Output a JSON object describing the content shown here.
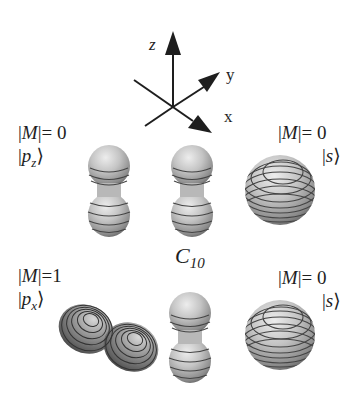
{
  "figure": {
    "axes": {
      "z_label": "z",
      "y_label": "y",
      "x_label": "x"
    },
    "center_label": {
      "main": "C",
      "subscript": "10"
    },
    "panels": {
      "top_left": {
        "m_prefix": "|",
        "m_var": "M",
        "m_suffix": "|= 0",
        "ket_open": "|",
        "ket_var": "p",
        "ket_sub": "z",
        "ket_close": "⟩"
      },
      "top_right": {
        "m_prefix": "|",
        "m_var": "M",
        "m_suffix": "|= 0",
        "ket_open": "|",
        "ket_var": "s",
        "ket_close": "⟩"
      },
      "bottom_left": {
        "m_prefix": "|",
        "m_var": "M",
        "m_suffix": "|=1",
        "ket_open": "|",
        "ket_var": "p",
        "ket_sub": "x",
        "ket_close": "⟩"
      },
      "bottom_right": {
        "m_prefix": "|",
        "m_var": "M",
        "m_suffix": "|= 0",
        "ket_open": "|",
        "ket_var": "s",
        "ket_close": "⟩"
      }
    },
    "orbitals": [
      {
        "name": "pz-orbital-top-left",
        "type": "dumbbell-vertical"
      },
      {
        "name": "pz-orbital-top-center",
        "type": "dumbbell-vertical"
      },
      {
        "name": "s-orbital-top-right",
        "type": "sphere"
      },
      {
        "name": "px-orbital-bottom-left",
        "type": "dumbbell-tilted"
      },
      {
        "name": "pz-orbital-bottom-center",
        "type": "dumbbell-vertical"
      },
      {
        "name": "s-orbital-bottom-right",
        "type": "sphere"
      }
    ],
    "colors": {
      "ink": "#1e1e1e",
      "shade_light": "#e6e6e6",
      "shade_mid": "#a8a8a8",
      "shade_dark": "#5a5a5a",
      "contour": "#3c3c3c"
    }
  }
}
